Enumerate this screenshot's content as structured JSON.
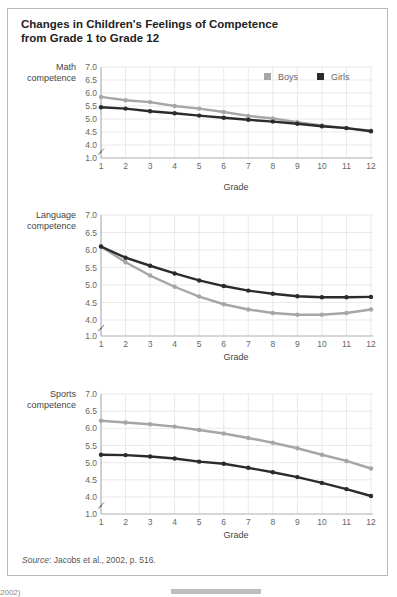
{
  "figure": {
    "title_line1": "Changes in Children's Feelings of Competence",
    "title_line2": "from Grade 1 to Grade 12",
    "source_label": "Source",
    "source_text": ": Jacobs et al., 2002, p. 516.",
    "bottom_left_fragment": "2002)"
  },
  "legend": {
    "boys": {
      "label": "Boys",
      "color": "#a6a6a6"
    },
    "girls": {
      "label": "Girls",
      "color": "#2b2b2b"
    }
  },
  "chart_data": [
    {
      "type": "line",
      "title": "Math competence",
      "ylabel_line1": "Math",
      "ylabel_line2": "competence",
      "xlabel": "Grade",
      "x": [
        1,
        2,
        3,
        4,
        5,
        6,
        7,
        8,
        9,
        10,
        11,
        12
      ],
      "yticks": [
        "1.0",
        "4.0",
        "4.5",
        "5.0",
        "5.5",
        "6.0",
        "6.5",
        "7.0"
      ],
      "ylim": [
        1.0,
        7.0
      ],
      "axis_break": true,
      "grid": true,
      "legend_position": "top-right",
      "series": [
        {
          "name": "Boys",
          "values": [
            5.85,
            5.72,
            5.65,
            5.5,
            5.4,
            5.27,
            5.12,
            5.02,
            4.88,
            4.75,
            4.65,
            4.55
          ]
        },
        {
          "name": "Girls",
          "values": [
            5.45,
            5.4,
            5.3,
            5.22,
            5.13,
            5.05,
            4.97,
            4.9,
            4.82,
            4.72,
            4.65,
            4.53
          ]
        }
      ]
    },
    {
      "type": "line",
      "title": "Language competence",
      "ylabel_line1": "Language",
      "ylabel_line2": "competence",
      "xlabel": "Grade",
      "x": [
        1,
        2,
        3,
        4,
        5,
        6,
        7,
        8,
        9,
        10,
        11,
        12
      ],
      "yticks": [
        "1.0",
        "4.0",
        "4.5",
        "5.0",
        "5.5",
        "6.0",
        "6.5",
        "7.0"
      ],
      "ylim": [
        1.0,
        7.0
      ],
      "axis_break": true,
      "grid": true,
      "series": [
        {
          "name": "Boys",
          "values": [
            6.1,
            5.65,
            5.27,
            4.95,
            4.67,
            4.45,
            4.3,
            4.2,
            4.15,
            4.15,
            4.2,
            4.3
          ]
        },
        {
          "name": "Girls",
          "values": [
            6.1,
            5.78,
            5.55,
            5.33,
            5.13,
            4.97,
            4.84,
            4.75,
            4.68,
            4.65,
            4.65,
            4.66
          ]
        }
      ]
    },
    {
      "type": "line",
      "title": "Sports competence",
      "ylabel_line1": "Sports",
      "ylabel_line2": "competence",
      "xlabel": "Grade",
      "x": [
        1,
        2,
        3,
        4,
        5,
        6,
        7,
        8,
        9,
        10,
        11,
        12
      ],
      "yticks": [
        "1.0",
        "4.0",
        "4.5",
        "5.0",
        "5.5",
        "6.0",
        "6.5",
        "7.0"
      ],
      "ylim": [
        1.0,
        7.0
      ],
      "axis_break": true,
      "grid": true,
      "series": [
        {
          "name": "Boys",
          "values": [
            6.22,
            6.17,
            6.12,
            6.05,
            5.95,
            5.85,
            5.72,
            5.58,
            5.42,
            5.23,
            5.05,
            4.83
          ]
        },
        {
          "name": "Girls",
          "values": [
            5.23,
            5.22,
            5.18,
            5.12,
            5.03,
            4.97,
            4.85,
            4.72,
            4.58,
            4.41,
            4.23,
            4.03
          ]
        }
      ]
    }
  ]
}
